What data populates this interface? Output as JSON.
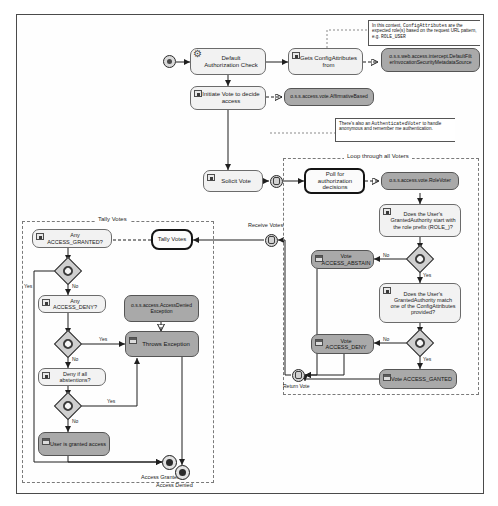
{
  "diagram": {
    "colors": {
      "gray_box": "#a9a9a9",
      "light_box": "#f2f2f2",
      "line": "#2b2b2b",
      "frame": "#4a4a4a"
    }
  },
  "regions": {
    "loop": {
      "label": "Loop through all Voters"
    },
    "tally": {
      "label": "Tally Votes"
    }
  },
  "nodes": {
    "default_auth_check": {
      "label": "Default\nAuthorization Check"
    },
    "gets_config_attributes": {
      "label": "Gets ConfigAttributes\nfrom"
    },
    "metadata_source": {
      "label": "o.s.s.web.access.intercept.DefaultFilt\nerInvocationSecurityMetadataSource"
    },
    "initiate_vote": {
      "label": "Initiate Vote to decide\naccess"
    },
    "affirmative_based": {
      "label": "o.s.s.access.vote.AffirmativeBased"
    },
    "solicit_vote": {
      "label": "Solicit Vote"
    },
    "poll_for_decisions": {
      "label": "Poll for authorization\ndecisions"
    },
    "role_voter": {
      "label": "o.s.s.access.vote.RoleVoter"
    },
    "role_prefix_check": {
      "label": "Does the User's\nGrantedAuthority start with\nthe role prefix (ROLE_)?"
    },
    "vote_abstain": {
      "label": "Vote ACCESS_ABSTAIN"
    },
    "attribute_match_check": {
      "label": "Does the User's\nGrantedAuthority match\none of the ConfigAttributes\nprovided?"
    },
    "vote_deny": {
      "label": "Vote ACCESS_DENY"
    },
    "vote_granted": {
      "label": "Vote ACCESS_GANTED"
    },
    "tally_votes": {
      "label": "Tally Votes"
    },
    "any_access_granted": {
      "label": "Any ACCESS_GRANTED?"
    },
    "any_access_deny": {
      "label": "Any ACCESS_DENY?"
    },
    "access_denied_exception": {
      "label": "o.s.s.access.AccessDenied\nException"
    },
    "throws_exception": {
      "label": "Throws Exception"
    },
    "deny_if_abstentions": {
      "label": "Deny if all abstentions?"
    },
    "user_granted_access": {
      "label": "User is granted access"
    }
  },
  "notes": {
    "config_attributes_note": "In this context, ConfigAttributes are the expected role(s) based on the request URL pattern, e.g. ROLE_USER",
    "config_attributes_note_parts": {
      "p1": "In this context, ",
      "code1": "ConfigAttributes",
      "p2": " are the expected role(s) based on the request URL pattern, e.g. ",
      "code2": "ROLE_USER"
    },
    "authenticated_voter_note": "There's also an AuthenticatedVoter to handle anonymous and remember me authentication.",
    "authenticated_voter_note_parts": {
      "p1": "There's also an ",
      "code1": "AuthenticatedVoter",
      "p2": " to handle anonymous and remember me authentication."
    }
  },
  "edge_labels": {
    "receive_votes": "Receive Votes",
    "return_vote": "Return Vote",
    "access_granted": "Access Granted",
    "access_denied": "Access Denied",
    "yes_1": "Yes",
    "no_1": "No",
    "yes_2": "Yes",
    "no_2": "No",
    "yes_3": "Yes",
    "no_3": "No",
    "no_role": "No",
    "yes_role": "Yes",
    "no_match": "No",
    "yes_match": "Yes"
  }
}
